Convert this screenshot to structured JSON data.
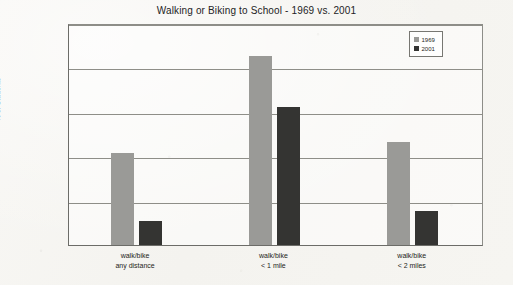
{
  "chart_data": {
    "type": "bar",
    "title": "Walking or Biking to School - 1969 vs. 2001",
    "xlabel": "",
    "ylabel": "% of Students",
    "ylim": [
      0,
      100
    ],
    "ytick_labels": [
      "100",
      "80",
      "60",
      "40",
      "20",
      "0"
    ],
    "ytick_values": [
      100,
      80,
      60,
      40,
      20,
      0
    ],
    "grid": "horizontal",
    "legend_position": "top-right",
    "categories": [
      "walk/bike any distance",
      "walk/bike < 1 mile",
      "walk/bike < 2 miles"
    ],
    "category_lines": [
      [
        "walk/bike",
        "any distance"
      ],
      [
        "walk/bike",
        "< 1 mile"
      ],
      [
        "walk/bike",
        "< 2 miles"
      ]
    ],
    "series": [
      {
        "name": "1969",
        "color": "#9a9a97",
        "values": [
          41.5,
          85,
          46.5
        ]
      },
      {
        "name": "2001",
        "color": "#343432",
        "values": [
          11,
          62,
          15.5
        ]
      }
    ]
  },
  "legend": {
    "entries": [
      {
        "label": "1969"
      },
      {
        "label": "2001"
      }
    ]
  }
}
